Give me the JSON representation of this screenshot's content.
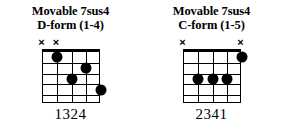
{
  "page": {
    "background": "#ffffff",
    "ink": "#000000"
  },
  "diagrams": [
    {
      "id": "d-form",
      "title_line1": "Movable 7sus4",
      "title_line2": "D-form (1-4)",
      "strings": 5,
      "frets": 5,
      "muted_strings": [
        1,
        2
      ],
      "mute_symbol": "×",
      "dots": [
        {
          "string": 2,
          "fret": 1
        },
        {
          "string": 4,
          "fret": 2
        },
        {
          "string": 3,
          "fret": 3
        },
        {
          "string": 5,
          "fret": 4
        }
      ],
      "fingering": "1324"
    },
    {
      "id": "c-form",
      "title_line1": "Movable 7sus4",
      "title_line2": "C-form (1-5)",
      "strings": 5,
      "frets": 5,
      "muted_strings": [
        1,
        5
      ],
      "mute_symbol": "×",
      "dots": [
        {
          "string": 5,
          "fret": 1
        },
        {
          "string": 2,
          "fret": 3
        },
        {
          "string": 3,
          "fret": 3
        },
        {
          "string": 4,
          "fret": 3
        }
      ],
      "fingering": "2341"
    }
  ]
}
